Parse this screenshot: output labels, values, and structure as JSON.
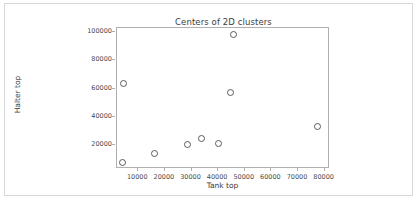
{
  "figure": {
    "background_color": "#ffffff",
    "border_color": "#d8d8d8",
    "axis_color": "#b0b0b0",
    "marker_color": "#5a5a5a",
    "text_color": "#3c3c3c"
  },
  "chart_data": {
    "type": "scatter",
    "title": "Centers of 2D clusters",
    "xlabel": "Tank top",
    "ylabel": "Halter top",
    "xlim": [
      2000,
      82000
    ],
    "ylim": [
      3000,
      103000
    ],
    "xticks": [
      10000,
      20000,
      30000,
      40000,
      50000,
      60000,
      70000,
      80000
    ],
    "yticks": [
      20000,
      40000,
      60000,
      80000,
      100000
    ],
    "xtick_labels": [
      "10000",
      "20000",
      "30000",
      "40000",
      "50000",
      "60000",
      "70000",
      "80000"
    ],
    "ytick_labels": [
      "20000",
      "40000",
      "60000",
      "80000",
      "100000"
    ],
    "grid": false,
    "legend": null,
    "marker": "open-circle",
    "series": [
      {
        "name": "cluster centers",
        "points": [
          {
            "x": 4500,
            "y": 7000
          },
          {
            "x": 4800,
            "y": 63000
          },
          {
            "x": 16500,
            "y": 13500
          },
          {
            "x": 29000,
            "y": 20000
          },
          {
            "x": 34000,
            "y": 24000
          },
          {
            "x": 40500,
            "y": 20500
          },
          {
            "x": 45000,
            "y": 56500
          },
          {
            "x": 46000,
            "y": 97500
          },
          {
            "x": 77500,
            "y": 32500
          }
        ]
      }
    ]
  }
}
